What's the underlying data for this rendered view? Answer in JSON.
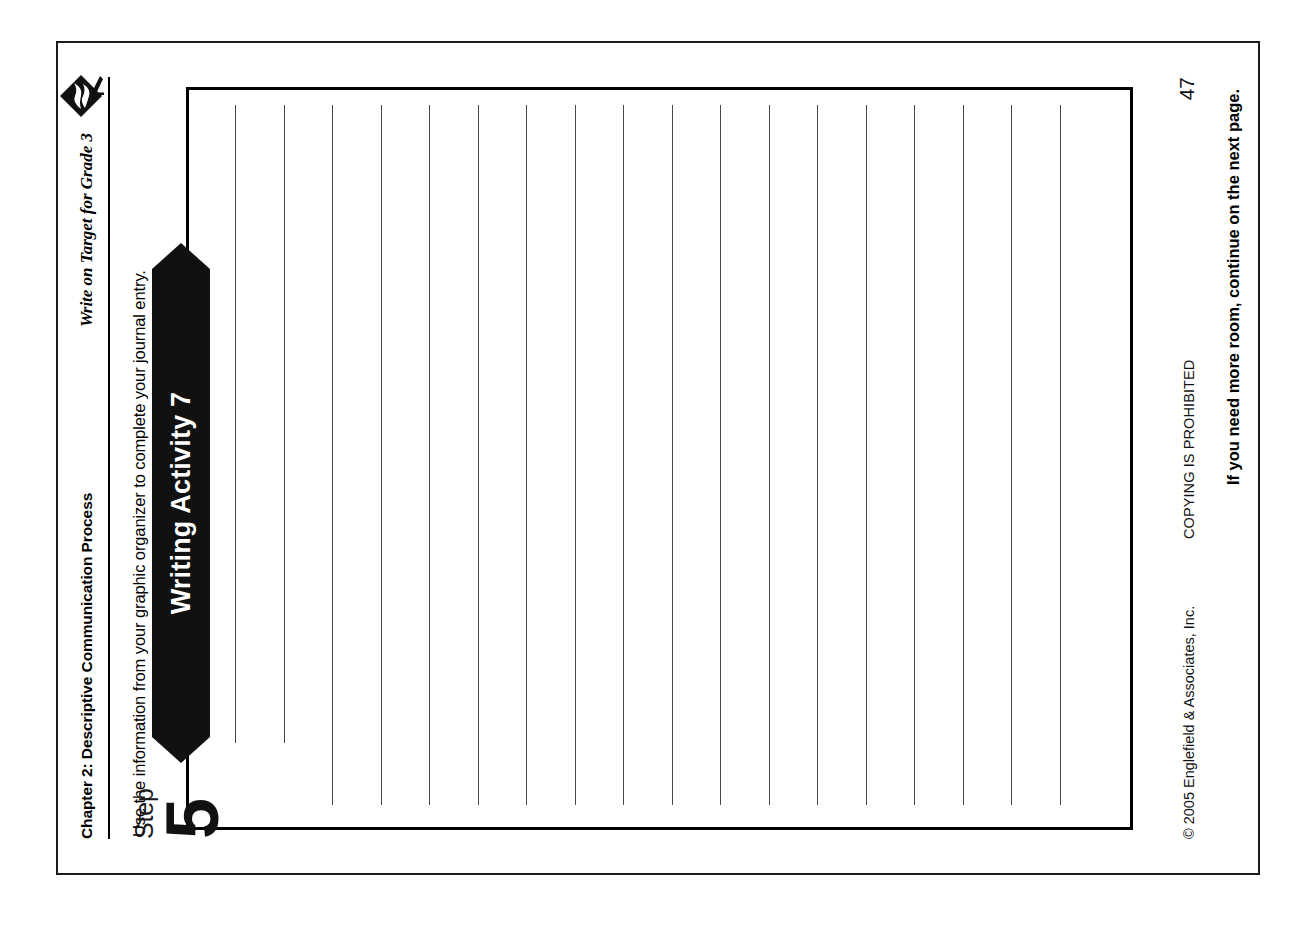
{
  "page": {
    "header": {
      "chapter": "Chapter 2: Descriptive Communication Process",
      "book_title": "Write on Target for Grade 3",
      "logo_icon": "target-diamond-logo-icon"
    },
    "instruction": "Use the information from your graphic organizer to complete your journal entry.",
    "activity": {
      "banner_label": "Writing Activity 7",
      "step_word": "Step",
      "step_number": "5",
      "ruled_lines_total": 18,
      "short_lines_count": 2,
      "note": "If you need more room, continue on the next page."
    },
    "footer": {
      "copyright": "© 2005 Englefield & Associates, Inc.",
      "prohibited": "COPYING IS PROHIBITED",
      "page_number": "47"
    },
    "colors": {
      "ink": "#111111",
      "banner_fill": "#111111",
      "banner_text": "#ffffff",
      "rule_line": "#4a4a4a",
      "paper": "#ffffff",
      "border": "#1a1a1a"
    }
  }
}
